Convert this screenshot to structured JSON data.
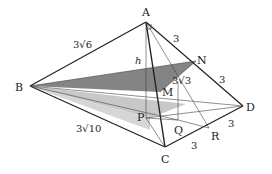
{
  "diagram": {
    "type": "pyramid-geometry",
    "points": {
      "A": {
        "label": "A",
        "x": 146,
        "y": 22
      },
      "B": {
        "label": "B",
        "x": 30,
        "y": 86
      },
      "C": {
        "label": "C",
        "x": 165,
        "y": 147
      },
      "D": {
        "label": "D",
        "x": 243,
        "y": 106
      },
      "N": {
        "label": "N",
        "x": 196,
        "y": 61
      },
      "M": {
        "label": "M",
        "x": 160,
        "y": 92
      },
      "P": {
        "label": "P",
        "x": 150,
        "y": 118
      },
      "Q": {
        "label": "Q",
        "x": 178,
        "y": 120
      },
      "R": {
        "label": "R",
        "x": 209,
        "y": 128
      }
    },
    "edge_labels": {
      "AB": "3√6",
      "BC": "3√10",
      "AN": "3",
      "ND": "3",
      "CR": "3",
      "RD": "3",
      "NM": "3√3",
      "height": "h"
    },
    "colors": {
      "line": "#222222",
      "shade_dark": "#6f6f6f",
      "shade_light": "#c8c8c8"
    }
  }
}
